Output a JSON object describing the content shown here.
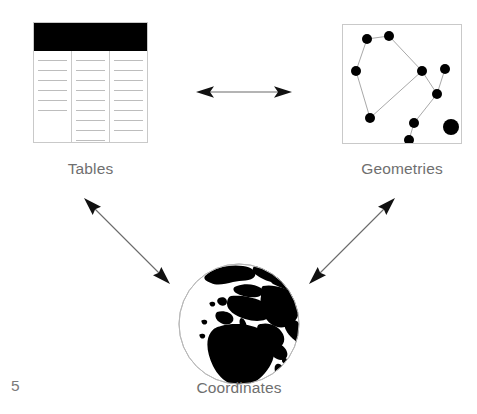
{
  "diagram": {
    "page_number": "5",
    "accent_color": "#000000",
    "line_color": "#c9c9c9",
    "text_color": "#6f6f6f",
    "nodes": [
      {
        "id": "tables",
        "label": "Tables",
        "icon": "table-icon",
        "columns": 3,
        "header_filled": true,
        "rows_per_column": [
          6,
          9,
          8
        ]
      },
      {
        "id": "geometries",
        "label": "Geometries",
        "icon": "point-network-icon",
        "points": [
          {
            "x": 24,
            "y": 14,
            "r": 5.0
          },
          {
            "x": 46,
            "y": 11,
            "r": 5.0
          },
          {
            "x": 13,
            "y": 46,
            "r": 5.0
          },
          {
            "x": 27,
            "y": 93,
            "r": 5.0
          },
          {
            "x": 79,
            "y": 46,
            "r": 5.0
          },
          {
            "x": 102,
            "y": 44,
            "r": 5.0
          },
          {
            "x": 94,
            "y": 69,
            "r": 5.0
          },
          {
            "x": 71,
            "y": 98,
            "r": 5.0
          },
          {
            "x": 66,
            "y": 115,
            "r": 5.0
          },
          {
            "x": 108,
            "y": 102,
            "r": 8.0
          }
        ],
        "edges": [
          [
            0,
            1
          ],
          [
            0,
            2
          ],
          [
            1,
            4
          ],
          [
            2,
            3
          ],
          [
            3,
            4
          ],
          [
            4,
            6
          ],
          [
            5,
            6
          ],
          [
            6,
            7
          ],
          [
            7,
            8
          ]
        ]
      },
      {
        "id": "coordinates",
        "label": "Coordinates",
        "icon": "globe-icon"
      }
    ],
    "arrows": [
      {
        "id": "tables-geometries",
        "from": "tables",
        "to": "geometries",
        "bidirectional": true,
        "orientation": "horizontal"
      },
      {
        "id": "tables-coordinates",
        "from": "tables",
        "to": "coordinates",
        "bidirectional": true,
        "orientation": "diagonal-down-right"
      },
      {
        "id": "geometries-coordinates",
        "from": "geometries",
        "to": "coordinates",
        "bidirectional": true,
        "orientation": "diagonal-down-left"
      }
    ]
  }
}
